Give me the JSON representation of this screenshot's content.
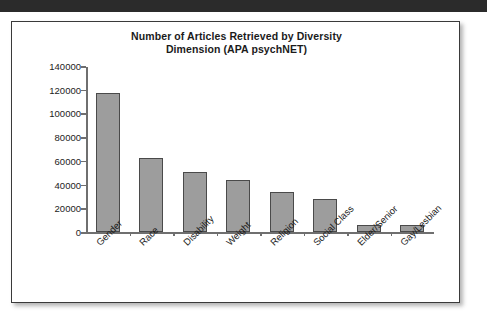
{
  "page": {
    "top_band_color": "#2b2b2b",
    "background_color": "#ffffff"
  },
  "figure": {
    "border_color": "#3a3a3a",
    "title_line1": "Number of Articles Retrieved by Diversity",
    "title_line2": "Dimension (APA psychNET)"
  },
  "chart_data": {
    "type": "bar",
    "title": "Number of Articles Retrieved by Diversity Dimension (APA psychNET)",
    "xlabel": "",
    "ylabel": "",
    "ylim": [
      0,
      140000
    ],
    "ytick_step": 20000,
    "yticks": [
      0,
      20000,
      40000,
      60000,
      80000,
      100000,
      120000,
      140000
    ],
    "ytick_labels": [
      "0",
      "20000",
      "40000",
      "60000",
      "80000",
      "100000",
      "120000",
      "140000"
    ],
    "grid": false,
    "legend": false,
    "bar_color": "#9d9d9d",
    "bar_edge_color": "#4a4a4a",
    "xtick_label_rotation": -45,
    "categories": [
      "Gender",
      "Race",
      "Disability",
      "Weight",
      "Religion",
      "Social Class",
      "Elder/Senior",
      "Gay/Lesbian"
    ],
    "values": [
      117000,
      62000,
      51000,
      44000,
      34000,
      28000,
      6000,
      5500
    ]
  }
}
